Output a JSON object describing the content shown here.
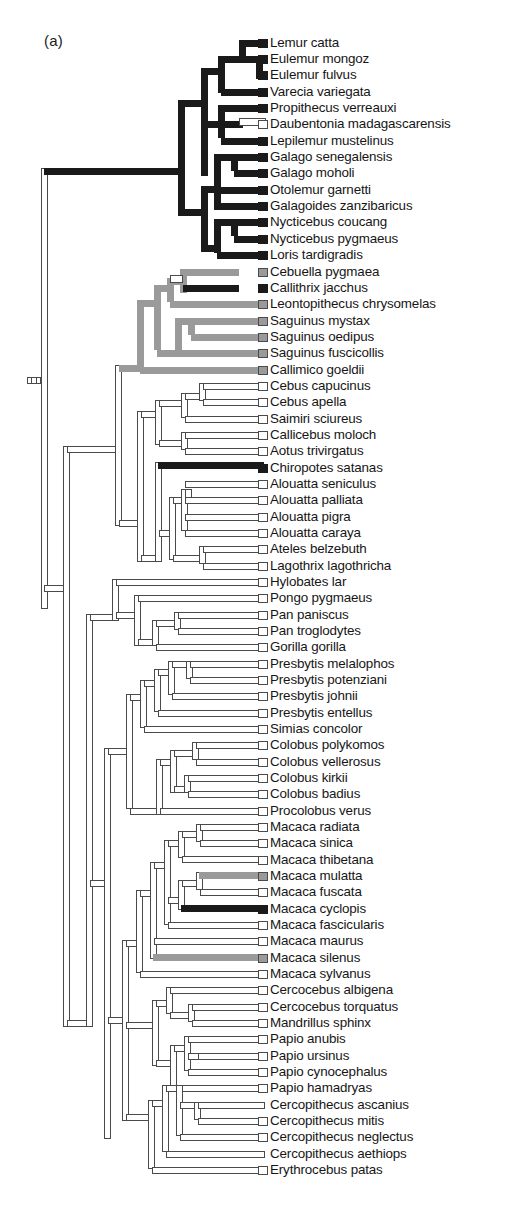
{
  "figure": {
    "panel_label": "(a)",
    "type": "phylogenetic-cladogram",
    "orientation": "left-to-right",
    "taxa_count": 72,
    "colors": {
      "black_branch": "#1a1a1a",
      "gray_branch": "#9a9a9a",
      "white_branch": "#ffffff",
      "outline": "#4a4a4a",
      "text": "#161616",
      "background": "#ffffff"
    },
    "legend_note": "Branch fill encodes a discrete character state: black = state 1, gray = intermediate state, white/open = state 0"
  },
  "scale_mark": {
    "name": "root-scale-tick",
    "segments": 3
  },
  "taxa": [
    {
      "i": 0,
      "label": "Lemur catta",
      "y": 43,
      "tip": "black"
    },
    {
      "i": 1,
      "label": "Eulemur mongoz",
      "y": 59,
      "tip": "black"
    },
    {
      "i": 2,
      "label": "Eulemur  fulvus",
      "y": 75,
      "tip": "black"
    },
    {
      "i": 3,
      "label": "Varecia variegata",
      "y": 92,
      "tip": "black"
    },
    {
      "i": 4,
      "label": "Propithecus  verreauxi",
      "y": 108,
      "tip": "black"
    },
    {
      "i": 5,
      "label": "Daubentonia madagascarensis",
      "y": 124,
      "tip": "white"
    },
    {
      "i": 6,
      "label": "Lepilemur  mustelinus",
      "y": 141,
      "tip": "black"
    },
    {
      "i": 7,
      "label": "Galago senegalensis",
      "y": 157,
      "tip": "black"
    },
    {
      "i": 8,
      "label": "Galago  moholi",
      "y": 173,
      "tip": "black"
    },
    {
      "i": 9,
      "label": "Otolemur  garnetti",
      "y": 190,
      "tip": "black"
    },
    {
      "i": 10,
      "label": "Galagoides zanzibaricus",
      "y": 206,
      "tip": "black"
    },
    {
      "i": 11,
      "label": "Nycticebus coucang",
      "y": 222,
      "tip": "black"
    },
    {
      "i": 12,
      "label": "Nycticebus pygmaeus",
      "y": 239,
      "tip": "black"
    },
    {
      "i": 13,
      "label": "Loris  tardigradis",
      "y": 255,
      "tip": "black"
    },
    {
      "i": 14,
      "label": "Cebuella pygmaea",
      "y": 272,
      "tip": "gray"
    },
    {
      "i": 15,
      "label": "Callithrix  jacchus",
      "y": 288,
      "tip": "black"
    },
    {
      "i": 16,
      "label": "Leontopithecus chrysomelas",
      "y": 304,
      "tip": "gray"
    },
    {
      "i": 17,
      "label": "Saguinus mystax",
      "y": 321,
      "tip": "gray"
    },
    {
      "i": 18,
      "label": "Saguinus oedipus",
      "y": 337,
      "tip": "gray"
    },
    {
      "i": 19,
      "label": "Saguinus fuscicollis",
      "y": 353,
      "tip": "gray"
    },
    {
      "i": 20,
      "label": "Callimico  goeldii",
      "y": 370,
      "tip": "gray"
    },
    {
      "i": 21,
      "label": "Cebus capucinus",
      "y": 386,
      "tip": "white"
    },
    {
      "i": 22,
      "label": "Cebus apella",
      "y": 402,
      "tip": "white"
    },
    {
      "i": 23,
      "label": "Saimiri  sciureus",
      "y": 419,
      "tip": "white"
    },
    {
      "i": 24,
      "label": "Callicebus moloch",
      "y": 435,
      "tip": "white"
    },
    {
      "i": 25,
      "label": "Aotus  trivirgatus",
      "y": 451,
      "tip": "white"
    },
    {
      "i": 26,
      "label": "Chiropotes satanas",
      "y": 468,
      "tip": "black"
    },
    {
      "i": 27,
      "label": "Alouatta seniculus",
      "y": 484,
      "tip": "white"
    },
    {
      "i": 28,
      "label": "Alouatta  palliata",
      "y": 500,
      "tip": "white"
    },
    {
      "i": 29,
      "label": "Alouatta  pigra",
      "y": 517,
      "tip": "white"
    },
    {
      "i": 30,
      "label": "Alouatta caraya",
      "y": 533,
      "tip": "white"
    },
    {
      "i": 31,
      "label": "Ateles belzebuth",
      "y": 549,
      "tip": "white"
    },
    {
      "i": 32,
      "label": "Lagothrix  lagothricha",
      "y": 566,
      "tip": "white"
    },
    {
      "i": 33,
      "label": "Hylobates  lar",
      "y": 582,
      "tip": "white"
    },
    {
      "i": 34,
      "label": "Pongo pygmaeus",
      "y": 598,
      "tip": "white"
    },
    {
      "i": 35,
      "label": "Pan paniscus",
      "y": 615,
      "tip": "white"
    },
    {
      "i": 36,
      "label": "Pan troglodytes",
      "y": 631,
      "tip": "white"
    },
    {
      "i": 37,
      "label": "Gorilla  gorilla",
      "y": 647,
      "tip": "white"
    },
    {
      "i": 38,
      "label": "Presbytis  melalophos",
      "y": 664,
      "tip": "white"
    },
    {
      "i": 39,
      "label": "Presbytis  potenziani",
      "y": 680,
      "tip": "white"
    },
    {
      "i": 40,
      "label": "Presbytis   johnii",
      "y": 696,
      "tip": "white"
    },
    {
      "i": 41,
      "label": "Presbytis  entellus",
      "y": 713,
      "tip": "white"
    },
    {
      "i": 42,
      "label": "Simias concolor",
      "y": 729,
      "tip": "white"
    },
    {
      "i": 43,
      "label": "Colobus polykomos",
      "y": 745,
      "tip": "white"
    },
    {
      "i": 44,
      "label": "Colobus vellerosus",
      "y": 762,
      "tip": "white"
    },
    {
      "i": 45,
      "label": "Colobus  kirkii",
      "y": 778,
      "tip": "white"
    },
    {
      "i": 46,
      "label": "Colobus badius",
      "y": 794,
      "tip": "white"
    },
    {
      "i": 47,
      "label": "Procolobus verus",
      "y": 811,
      "tip": "white"
    },
    {
      "i": 48,
      "label": "Macaca radiata",
      "y": 827,
      "tip": "white"
    },
    {
      "i": 49,
      "label": "Macaca sinica",
      "y": 843,
      "tip": "white"
    },
    {
      "i": 50,
      "label": "Macaca thibetana",
      "y": 860,
      "tip": "white"
    },
    {
      "i": 51,
      "label": "Macaca mulatta",
      "y": 876,
      "tip": "gray"
    },
    {
      "i": 52,
      "label": "Macaca fuscata",
      "y": 892,
      "tip": "white"
    },
    {
      "i": 53,
      "label": "Macaca cyclopis",
      "y": 909,
      "tip": "black"
    },
    {
      "i": 54,
      "label": "Macaca  fascicularis",
      "y": 925,
      "tip": "white"
    },
    {
      "i": 55,
      "label": "Macaca maurus",
      "y": 941,
      "tip": "white"
    },
    {
      "i": 56,
      "label": "Macaca silenus",
      "y": 958,
      "tip": "gray"
    },
    {
      "i": 57,
      "label": "Macaca sylvanus",
      "y": 974,
      "tip": "white"
    },
    {
      "i": 58,
      "label": "Cercocebus albigena",
      "y": 990,
      "tip": "white"
    },
    {
      "i": 59,
      "label": "Cercocebus torquatus",
      "y": 1007,
      "tip": "white"
    },
    {
      "i": 60,
      "label": "Mandrillus  sphinx",
      "y": 1023,
      "tip": "white"
    },
    {
      "i": 61,
      "label": "Papio anubis",
      "y": 1039,
      "tip": "white"
    },
    {
      "i": 62,
      "label": "Papio  ursinus",
      "y": 1056,
      "tip": "white"
    },
    {
      "i": 63,
      "label": "Papio cynocephalus",
      "y": 1072,
      "tip": "white"
    },
    {
      "i": 64,
      "label": "Papio hamadryas",
      "y": 1088,
      "tip": "white"
    },
    {
      "i": 65,
      "label": "Cercopithecus ascanius",
      "y": 1105,
      "tip": "none"
    },
    {
      "i": 66,
      "label": "Cercopithecus  mitis",
      "y": 1121,
      "tip": "white"
    },
    {
      "i": 67,
      "label": "Cercopithecus neglectus",
      "y": 1137,
      "tip": "white"
    },
    {
      "i": 68,
      "label": "Cercopithecus aethiops",
      "y": 1154,
      "tip": "none"
    },
    {
      "i": 69,
      "label": "Erythrocebus  patas",
      "y": 1170,
      "tip": "white"
    }
  ],
  "chart_data": {
    "type": "tree",
    "title": "(a)",
    "tip_label_x": 270,
    "row_spacing": 16.35,
    "first_row_y": 43,
    "tip_states": {
      "black": [
        "Lemur catta",
        "Eulemur mongoz",
        "Eulemur  fulvus",
        "Varecia variegata",
        "Propithecus  verreauxi",
        "Lepilemur  mustelinus",
        "Galago senegalensis",
        "Galago  moholi",
        "Otolemur  garnetti",
        "Galagoides zanzibaricus",
        "Nycticebus coucang",
        "Nycticebus pygmaeus",
        "Loris  tardigradis",
        "Callithrix  jacchus",
        "Chiropotes satanas",
        "Macaca cyclopis"
      ],
      "gray": [
        "Cebuella pygmaea",
        "Leontopithecus chrysomelas",
        "Saguinus mystax",
        "Saguinus oedipus",
        "Saguinus fuscicollis",
        "Callimico  goeldii",
        "Macaca mulatta",
        "Macaca silenus"
      ],
      "white": [
        "Daubentonia madagascarensis",
        "Cebus capucinus",
        "Cebus apella",
        "Saimiri  sciureus",
        "Callicebus moloch",
        "Aotus  trivirgatus",
        "Alouatta seniculus",
        "Alouatta  palliata",
        "Alouatta  pigra",
        "Alouatta caraya",
        "Ateles belzebuth",
        "Lagothrix  lagothricha",
        "Hylobates  lar",
        "Pongo pygmaeus",
        "Pan paniscus",
        "Pan troglodytes",
        "Gorilla  gorilla",
        "Presbytis  melalophos",
        "Presbytis  potenziani",
        "Presbytis   johnii",
        "Presbytis  entellus",
        "Simias concolor",
        "Colobus polykomos",
        "Colobus vellerosus",
        "Colobus  kirkii",
        "Colobus badius",
        "Procolobus verus",
        "Macaca radiata",
        "Macaca sinica",
        "Macaca thibetana",
        "Macaca fuscata",
        "Macaca  fascicularis",
        "Macaca maurus",
        "Macaca sylvanus",
        "Cercocebus albigena",
        "Cercocebus torquatus",
        "Mandrillus  sphinx",
        "Papio anubis",
        "Papio  ursinus",
        "Papio cynocephalus",
        "Papio hamadryas",
        "Cercopithecus  mitis",
        "Cercopithecus neglectus",
        "Erythrocebus  patas"
      ]
    },
    "clades": [
      {
        "name": "Strepsirrhini",
        "state": "black",
        "members_from": "Lemur catta",
        "members_to": "Loris  tardigradis"
      },
      {
        "name": "Callitrichidae",
        "state": "gray",
        "members_from": "Cebuella pygmaea",
        "members_to": "Callimico  goeldii"
      },
      {
        "name": "Cebidae-Atelidae",
        "state": "white",
        "members_from": "Cebus capucinus",
        "members_to": "Lagothrix  lagothricha"
      },
      {
        "name": "Hominoidea",
        "state": "white",
        "members_from": "Hylobates  lar",
        "members_to": "Gorilla  gorilla"
      },
      {
        "name": "Colobinae",
        "state": "white",
        "members_from": "Presbytis  melalophos",
        "members_to": "Procolobus verus"
      },
      {
        "name": "Cercopithecinae",
        "state": "white",
        "members_from": "Macaca radiata",
        "members_to": "Erythrocebus  patas"
      }
    ]
  }
}
